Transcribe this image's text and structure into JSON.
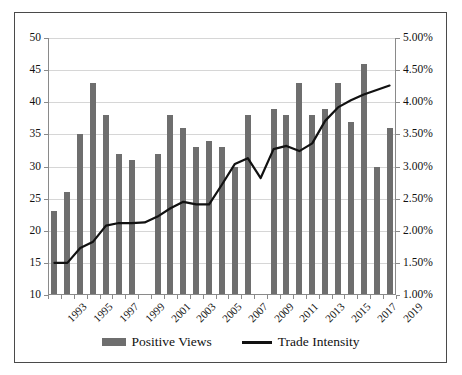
{
  "chart_data": {
    "type": "bar",
    "title": "",
    "subtitle": "",
    "xlabel": "",
    "ylabel": "",
    "y2label": "",
    "grid": true,
    "legend_position": "bottom",
    "x": [
      1993,
      1994,
      1995,
      1996,
      1997,
      1998,
      1999,
      2000,
      2001,
      2002,
      2003,
      2004,
      2005,
      2006,
      2007,
      2008,
      2009,
      2010,
      2011,
      2012,
      2013,
      2014,
      2015,
      2016,
      2017,
      2018,
      2019
    ],
    "xtick_labels": [
      "1993",
      "1995",
      "1997",
      "1999",
      "2001",
      "2003",
      "2005",
      "2007",
      "2009",
      "2011",
      "2013",
      "2015",
      "2017",
      "2019"
    ],
    "ylim": [
      10,
      50
    ],
    "ytick_labels": [
      "10",
      "15",
      "20",
      "25",
      "30",
      "35",
      "40",
      "45",
      "50"
    ],
    "ytick_values": [
      10,
      15,
      20,
      25,
      30,
      35,
      40,
      45,
      50
    ],
    "y2lim": [
      1.0,
      5.0
    ],
    "y2tick_labels": [
      "1.00%",
      "1.50%",
      "2.00%",
      "2.50%",
      "3.00%",
      "3.50%",
      "4.00%",
      "4.50%",
      "5.00%"
    ],
    "y2tick_values": [
      1.0,
      1.5,
      2.0,
      2.5,
      3.0,
      3.5,
      4.0,
      4.5,
      5.0
    ],
    "series": [
      {
        "name": "Positive Views",
        "type": "bar",
        "axis": "left",
        "color": "#6e6e6e",
        "values": [
          23,
          26,
          35,
          43,
          38,
          32,
          31,
          null,
          32,
          38,
          36,
          33,
          34,
          33,
          30,
          38,
          null,
          39,
          38,
          43,
          38,
          39,
          43,
          37,
          46,
          30,
          36
        ]
      },
      {
        "name": "Trade Intensity",
        "type": "line",
        "axis": "right",
        "color": "#111111",
        "values": [
          1.5,
          1.5,
          1.73,
          1.83,
          2.08,
          2.12,
          2.12,
          2.13,
          2.22,
          2.35,
          2.45,
          2.41,
          2.41,
          2.72,
          3.04,
          3.13,
          2.82,
          3.27,
          3.32,
          3.24,
          3.36,
          3.71,
          3.92,
          4.03,
          4.12,
          4.19,
          4.26
        ]
      }
    ]
  },
  "legend": {
    "items": [
      {
        "label": "Positive Views",
        "swatch": "bar-swatch",
        "color": "#6e6e6e"
      },
      {
        "label": "Trade Intensity",
        "swatch": "line-swatch",
        "color": "#111111"
      }
    ]
  }
}
